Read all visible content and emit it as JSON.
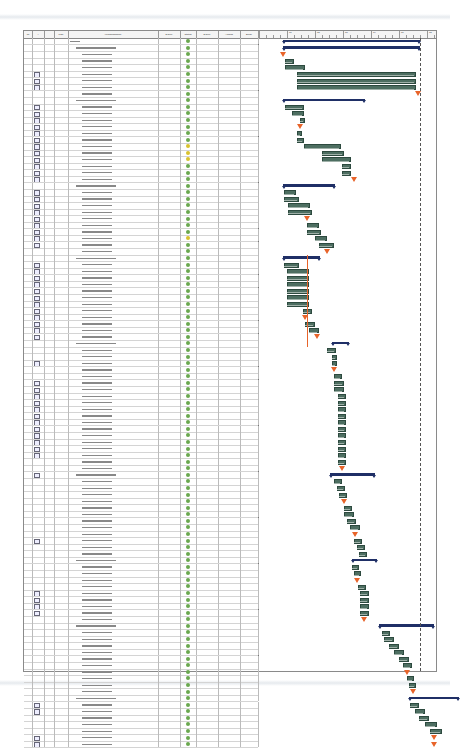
{
  "document": {
    "type": "Gantt chart project plan (printed/scanned view)",
    "note": "Text in screenshot is too small to read; labels below are structural placeholders"
  },
  "table": {
    "columns": [
      {
        "key": "nr",
        "label": "Nr",
        "width": 8
      },
      {
        "key": "ind",
        "label": "i",
        "width": 12
      },
      {
        "key": "chk",
        "label": "",
        "width": 10
      },
      {
        "key": "psp",
        "label": "PSP",
        "width": 14
      },
      {
        "key": "name",
        "label": "Vorgangsname",
        "width": 90
      },
      {
        "key": "dur_pct",
        "label": "Dauer",
        "width": 22
      },
      {
        "key": "status",
        "label": "Status",
        "width": 16
      },
      {
        "key": "dauer",
        "label": "Dauer",
        "width": 22
      },
      {
        "key": "start",
        "label": "Anfang",
        "width": 22
      },
      {
        "key": "end",
        "label": "Ende",
        "width": 18
      }
    ]
  },
  "gantt": {
    "months": [
      "",
      "Q1",
      "Q2",
      "Q3",
      "Q4",
      "Q1",
      "Q2"
    ],
    "colors": {
      "task": "#4d6e61",
      "summary": "#1f2f66",
      "milestone": "#e8642a",
      "status_ok": "#6aa84f",
      "status_warn": "#d9c22e"
    }
  },
  "rows": []
}
